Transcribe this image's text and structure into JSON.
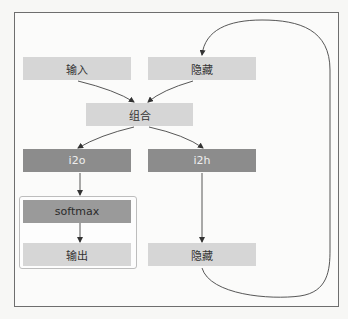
{
  "diagram": {
    "type": "rnn-cell-flow",
    "nodes": {
      "input": {
        "label": "输入"
      },
      "hidden_in": {
        "label": "隐藏"
      },
      "combined": {
        "label": "组合"
      },
      "i2o": {
        "label": "i2o"
      },
      "i2h": {
        "label": "i2h"
      },
      "softmax": {
        "label": "softmax"
      },
      "output": {
        "label": "输出"
      },
      "hidden_out": {
        "label": "隐藏"
      }
    },
    "edges": [
      {
        "from": "输入",
        "to": "组合"
      },
      {
        "from": "隐藏",
        "to": "组合"
      },
      {
        "from": "组合",
        "to": "i2o"
      },
      {
        "from": "组合",
        "to": "i2h"
      },
      {
        "from": "i2o",
        "to": "softmax"
      },
      {
        "from": "softmax",
        "to": "输出"
      },
      {
        "from": "i2h",
        "to": "隐藏"
      },
      {
        "from": "隐藏 (output)",
        "to": "隐藏 (input)",
        "style": "loop"
      }
    ],
    "colors": {
      "light_node": "#d6d6d6",
      "mid_node": "#9a9a9a",
      "dark_node": "#8c8c8c",
      "line": "#333333",
      "frame": "#6e6e6e"
    }
  }
}
